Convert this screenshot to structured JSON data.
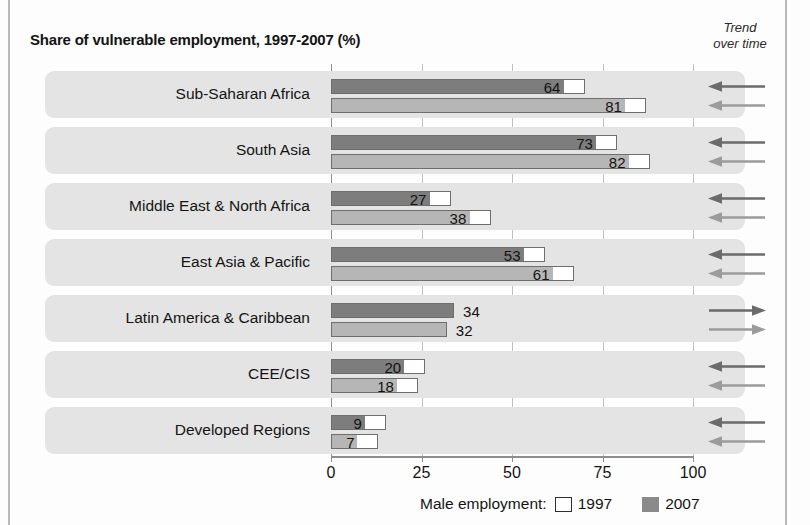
{
  "header": {
    "title": "Share of vulnerable employment, 1997-2007 (%)",
    "trend_label_line1": "Trend",
    "trend_label_line2": "over time"
  },
  "legend": {
    "prefix": "Male employment:",
    "item_1997": "1997",
    "item_2007": "2007",
    "swatch_1997_color": "#ffffff",
    "swatch_2007_color": "#8a8a8a"
  },
  "axis": {
    "ticks": [
      "0",
      "25",
      "50",
      "75",
      "100"
    ],
    "min": 0,
    "max": 100
  },
  "colors": {
    "bar_2007": "#7d7d7d",
    "bar_1997": "#b6b6b6",
    "band": "#e4e4e4",
    "grid": "#c0c0c0",
    "frame": "#b9b9b9"
  },
  "chart_data": {
    "type": "bar",
    "title": "Share of vulnerable employment, 1997-2007 (%)",
    "xlabel": "",
    "ylabel": "",
    "xlim": [
      0,
      100
    ],
    "xticks": [
      0,
      25,
      50,
      75,
      100
    ],
    "grid": true,
    "orientation": "horizontal",
    "legend_position": "bottom",
    "categories": [
      "Sub-Saharan Africa",
      "South Asia",
      "Middle East & North Africa",
      "East Asia & Pacific",
      "Latin America & Caribbean",
      "CEE/CIS",
      "Developed Regions"
    ],
    "series": [
      {
        "name": "2007",
        "values": [
          64,
          73,
          27,
          53,
          34,
          20,
          9
        ]
      },
      {
        "name": "1997",
        "values": [
          81,
          82,
          38,
          61,
          32,
          18,
          7
        ]
      }
    ],
    "trend_over_time": [
      {
        "category": "Sub-Saharan Africa",
        "2007": "left",
        "1997": "left"
      },
      {
        "category": "South Asia",
        "2007": "left",
        "1997": "left"
      },
      {
        "category": "Middle East & North Africa",
        "2007": "left",
        "1997": "left"
      },
      {
        "category": "East Asia & Pacific",
        "2007": "left",
        "1997": "left"
      },
      {
        "category": "Latin America & Caribbean",
        "2007": "right",
        "1997": "right"
      },
      {
        "category": "CEE/CIS",
        "2007": "left",
        "1997": "left"
      },
      {
        "category": "Developed Regions",
        "2007": "left",
        "1997": "left"
      }
    ]
  }
}
